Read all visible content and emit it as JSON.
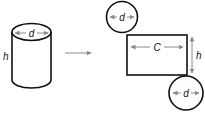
{
  "diagram": {
    "type": "cylinder-net",
    "colors": {
      "outline": "#111111",
      "dimension": "#8a8a8a",
      "background": "#ffffff"
    },
    "cylinder": {
      "labels": {
        "diameter": "d",
        "height": "h"
      }
    },
    "transform_arrow": {
      "direction": "right"
    },
    "net": {
      "top_circle": {
        "label": "d"
      },
      "rectangle": {
        "width_label": "C",
        "height_label": "h"
      },
      "bottom_circle": {
        "label": "d"
      }
    }
  }
}
